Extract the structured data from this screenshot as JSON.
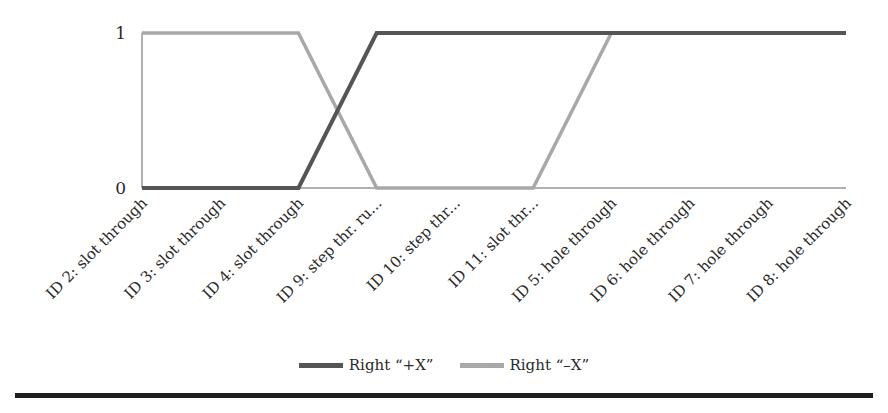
{
  "chart_data": {
    "type": "line",
    "title": "",
    "xlabel": "",
    "ylabel": "",
    "ylim": [
      0,
      1
    ],
    "yticks": [
      "0",
      "1"
    ],
    "grid": false,
    "legend_position": "bottom",
    "categories": [
      "ID 2: slot through",
      "ID 3: slot through",
      "ID 4: slot through",
      "ID 9: step thr. ru...",
      "ID 10: step thr...",
      "ID 11: slot thr...",
      "ID 5: hole through",
      "ID 6: hole through",
      "ID 7: hole through",
      "ID 8: hole through"
    ],
    "series": [
      {
        "name": "Right “+X”",
        "color": "#555555",
        "values": [
          0,
          0,
          0,
          1,
          1,
          1,
          1,
          1,
          1,
          1
        ]
      },
      {
        "name": "Right “–X”",
        "color": "#a8a8a8",
        "values": [
          1,
          1,
          1,
          0,
          0,
          0,
          1,
          1,
          1,
          1
        ]
      }
    ]
  },
  "legend": {
    "items": [
      {
        "label": "Right “+X”",
        "color": "#555555"
      },
      {
        "label": "Right “–X”",
        "color": "#a8a8a8"
      }
    ]
  }
}
